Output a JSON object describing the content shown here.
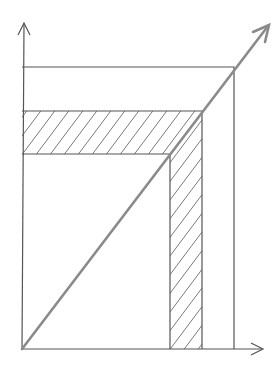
{
  "diagram": {
    "type": "geometric-sketch",
    "colors": {
      "background": "#ffffff",
      "lines": "#555555",
      "diagonal": "#8a8a8a",
      "hatch": "#6a6a6a"
    },
    "origin": [
      22,
      349
    ],
    "y_axis_tip": [
      24,
      22
    ],
    "x_axis_tip": [
      263,
      349
    ],
    "diagonal_tip": [
      269,
      25
    ],
    "outer_square_corner": [
      234,
      67
    ],
    "hatched_outer_corner": [
      202,
      111
    ],
    "hatched_inner_corner": [
      170,
      154
    ],
    "hatch_spacing": 14
  }
}
